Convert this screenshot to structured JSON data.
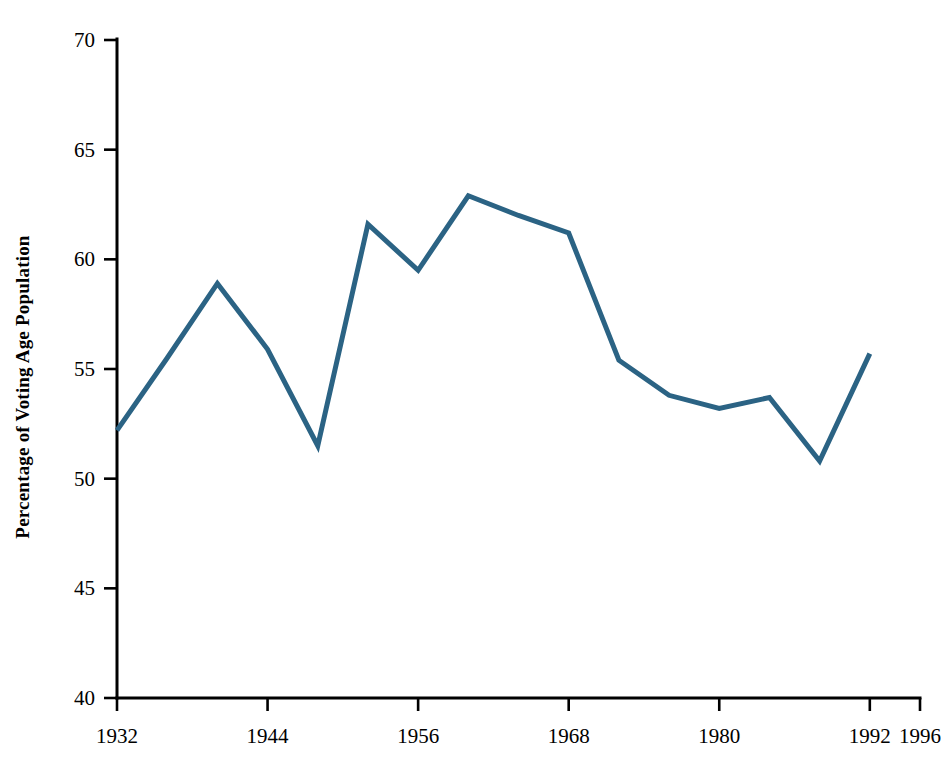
{
  "chart_data": {
    "type": "line",
    "title": "",
    "subtitle": "",
    "xlabel": "",
    "ylabel": "Percentage of Voting Age Population",
    "x": [
      1932,
      1936,
      1940,
      1944,
      1948,
      1952,
      1956,
      1960,
      1964,
      1968,
      1972,
      1976,
      1980,
      1984,
      1988,
      1992
    ],
    "values": [
      52.2,
      55.5,
      58.9,
      55.9,
      51.5,
      61.6,
      59.5,
      62.9,
      62.0,
      61.2,
      55.4,
      53.8,
      53.2,
      53.7,
      50.8,
      55.7
    ],
    "series": [
      {
        "name": "Voter Turnout",
        "values": [
          52.2,
          55.5,
          58.9,
          55.9,
          51.5,
          61.6,
          59.5,
          62.9,
          62.0,
          61.2,
          55.4,
          53.8,
          53.2,
          53.7,
          50.8,
          55.7
        ]
      }
    ],
    "xlim": [
      1932,
      1996
    ],
    "ylim": [
      40,
      70
    ],
    "x_ticks": [
      1932,
      1936,
      1940,
      1944,
      1948,
      1952,
      1956,
      1960,
      1964,
      1968,
      1972,
      1976,
      1980,
      1984,
      1988,
      1992,
      1996
    ],
    "x_tick_labels": [
      "1932",
      "",
      "",
      "1944",
      "",
      "",
      "1956",
      "",
      "",
      "1968",
      "",
      "",
      "1980",
      "",
      "",
      "1992",
      "1996"
    ],
    "y_ticks": [
      40,
      45,
      50,
      55,
      60,
      65,
      70
    ],
    "y_tick_labels": [
      "40",
      "45",
      "50",
      "55",
      "60",
      "65",
      "70"
    ],
    "grid": false,
    "legend": false,
    "legend_position": "none",
    "line_color": "#2b6384",
    "axis_color": "#000000",
    "background_color": "#ffffff"
  }
}
